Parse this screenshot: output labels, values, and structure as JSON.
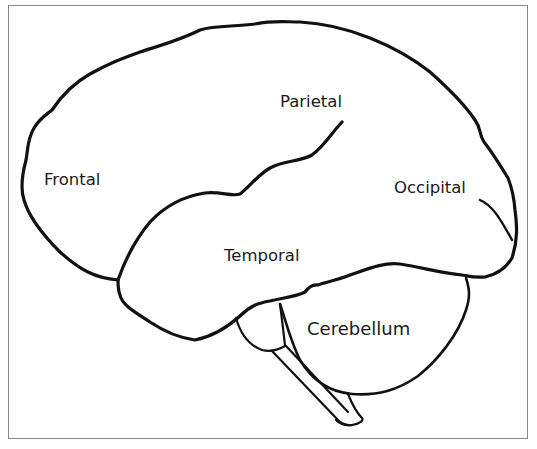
{
  "diagram": {
    "type": "brain-lateral-view",
    "labels": {
      "frontal": "Frontal",
      "parietal": "Parietal",
      "occipital": "Occipital",
      "temporal": "Temporal",
      "cerebellum": "Cerebellum"
    },
    "colors": {
      "outline": "#111111",
      "frame": "#8a8a8a",
      "text": "#1a1a1a",
      "background": "#ffffff"
    }
  }
}
